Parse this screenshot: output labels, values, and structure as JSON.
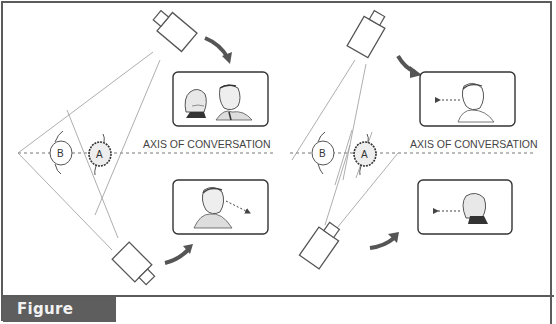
{
  "figure": {
    "caption": "Figure 4.12",
    "colors": {
      "frame": "#5b5b5b",
      "caption_bg": "#5e5e5e",
      "caption_text": "#f2f2f2",
      "arrow": "#555555",
      "line": "#888888"
    }
  },
  "left_panel": {
    "axis_label": "AXIS OF CONVERSATION",
    "person_b": "B",
    "person_a": "A",
    "top_frame_desc": "woman and man facing each other (two-shot)",
    "bottom_frame_desc": "man looking right, arrow pointing right"
  },
  "right_panel": {
    "axis_label": "AXIS OF CONVERSATION",
    "person_b": "B",
    "person_a": "A",
    "top_frame_desc": "man looking left, arrow pointing left",
    "bottom_frame_desc": "woman looking left, arrow pointing left"
  }
}
